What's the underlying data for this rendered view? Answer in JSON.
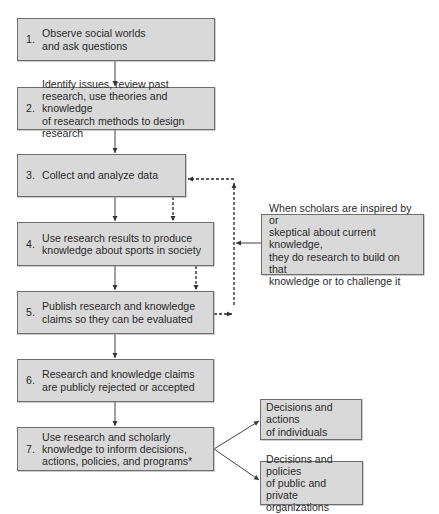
{
  "diagram": {
    "steps": [
      {
        "num": "1.",
        "text": "Observe social worlds\nand ask questions"
      },
      {
        "num": "2.",
        "text": "Identify issues, review past\nresearch, use theories and knowledge\nof research methods to design research"
      },
      {
        "num": "3.",
        "text": "Collect and analyze data"
      },
      {
        "num": "4.",
        "text": "Use research results to produce\nknowledge about sports in society"
      },
      {
        "num": "5.",
        "text": "Publish research and knowledge\nclaims so they can be evaluated"
      },
      {
        "num": "6.",
        "text": "Research and knowledge claims\nare publicly rejected or accepted"
      },
      {
        "num": "7.",
        "text": "Use research and scholarly\nknowledge to inform decisions,\nactions, policies, and programs*"
      }
    ],
    "side_note": "When scholars are inspired by or\nskeptical about current knowledge,\nthey do research to build on that\nknowledge or to challenge it",
    "outcomes": [
      {
        "text": "Decisions and actions\nof individuals"
      },
      {
        "text": "Decisions and policies\nof public and private\norganizations"
      }
    ],
    "colors": {
      "box_fill": "#d9d9d9",
      "box_border": "#6e6e6e",
      "line": "#333333"
    }
  }
}
